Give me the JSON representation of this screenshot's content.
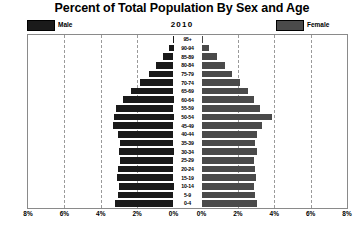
{
  "chart_data": {
    "type": "bar",
    "subtype": "population-pyramid",
    "title": "Percent of Total Population By Sex and Age",
    "year_label": "2010",
    "xlabel": "",
    "ylabel": "",
    "grid": true,
    "legend_position": "top",
    "axis_max_percent": 8,
    "gridline_values": [
      2,
      4,
      6
    ],
    "xtick_labels_left": [
      "8%",
      "6%",
      "4%",
      "2%",
      "0%"
    ],
    "xtick_labels_right": [
      "0%",
      "2%",
      "4%",
      "6%",
      "8%"
    ],
    "legend": [
      {
        "name": "Male",
        "color": "#1a1a1a"
      },
      {
        "name": "Female",
        "color": "#4a4a4a"
      }
    ],
    "categories": [
      "95+",
      "90-94",
      "85-89",
      "80-84",
      "75-79",
      "70-74",
      "65-69",
      "60-64",
      "55-59",
      "50-54",
      "45-49",
      "40-44",
      "35-39",
      "30-34",
      "25-29",
      "20-24",
      "15-19",
      "10-14",
      "5-9",
      "0-4"
    ],
    "series": [
      {
        "name": "Male",
        "color": "#1a1a1a",
        "values": [
          0.05,
          0.25,
          0.55,
          0.95,
          1.35,
          1.85,
          2.35,
          2.75,
          3.15,
          3.25,
          3.3,
          3.05,
          2.95,
          3.0,
          2.95,
          3.05,
          3.1,
          3.0,
          3.05,
          3.2
        ]
      },
      {
        "name": "Female",
        "color": "#4a4a4a",
        "values": [
          0.1,
          0.4,
          0.85,
          1.3,
          1.7,
          2.1,
          2.55,
          2.9,
          3.2,
          3.9,
          3.35,
          3.05,
          2.95,
          3.05,
          2.9,
          2.95,
          3.0,
          2.9,
          2.95,
          3.05
        ]
      }
    ]
  }
}
